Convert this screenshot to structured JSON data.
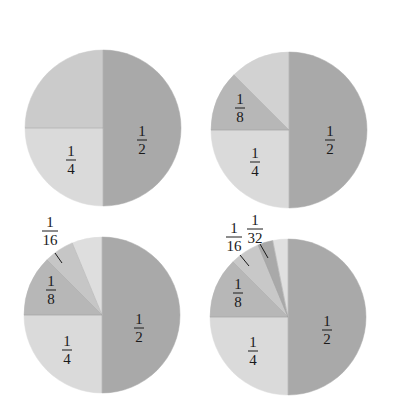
{
  "chart_data": [
    {
      "type": "pie",
      "title": "",
      "center": [
        103,
        128
      ],
      "radius": 78,
      "slices": [
        {
          "label": "1/2",
          "value": 0.5,
          "num": "1",
          "den": "2",
          "color": "#a9a9a9",
          "start": 0,
          "end": 180,
          "labelPos": [
            142,
            140
          ]
        },
        {
          "label": "1/4",
          "value": 0.25,
          "num": "1",
          "den": "4",
          "color": "#dadada",
          "start": 180,
          "end": 270,
          "labelPos": [
            71,
            160
          ]
        },
        {
          "label": "",
          "value": 0.25,
          "num": "",
          "den": "",
          "color": "#cbcbcb",
          "start": 270,
          "end": 360,
          "labelPos": null
        }
      ]
    },
    {
      "type": "pie",
      "title": "",
      "center": [
        289,
        130
      ],
      "radius": 78,
      "slices": [
        {
          "label": "1/2",
          "value": 0.5,
          "num": "1",
          "den": "2",
          "color": "#a9a9a9",
          "start": 0,
          "end": 180,
          "labelPos": [
            330,
            140
          ]
        },
        {
          "label": "1/4",
          "value": 0.25,
          "num": "1",
          "den": "4",
          "color": "#dadada",
          "start": 180,
          "end": 270,
          "labelPos": [
            255,
            162
          ]
        },
        {
          "label": "1/8",
          "value": 0.125,
          "num": "1",
          "den": "8",
          "color": "#b7b7b7",
          "start": 270,
          "end": 315,
          "labelPos": [
            240,
            108
          ]
        },
        {
          "label": "",
          "value": 0.125,
          "num": "",
          "den": "",
          "color": "#d2d2d2",
          "start": 315,
          "end": 360,
          "labelPos": null
        }
      ]
    },
    {
      "type": "pie",
      "title": "",
      "center": [
        102,
        315
      ],
      "radius": 78,
      "slices": [
        {
          "label": "1/2",
          "value": 0.5,
          "num": "1",
          "den": "2",
          "color": "#a9a9a9",
          "start": 0,
          "end": 180,
          "labelPos": [
            139,
            328
          ]
        },
        {
          "label": "1/4",
          "value": 0.25,
          "num": "1",
          "den": "4",
          "color": "#dadada",
          "start": 180,
          "end": 270,
          "labelPos": [
            67,
            350
          ]
        },
        {
          "label": "1/8",
          "value": 0.125,
          "num": "1",
          "den": "8",
          "color": "#b7b7b7",
          "start": 270,
          "end": 315,
          "labelPos": [
            51,
            290
          ]
        },
        {
          "label": "1/16",
          "value": 0.0625,
          "num": "1",
          "den": "16",
          "color": "#c6c6c6",
          "start": 315,
          "end": 337.5,
          "labelPos": [
            50,
            231
          ],
          "leader": [
            [
              55,
              253
            ],
            [
              62,
              263
            ]
          ]
        },
        {
          "label": "",
          "value": 0.0625,
          "num": "",
          "den": "",
          "color": "#dedede",
          "start": 337.5,
          "end": 360,
          "labelPos": null
        }
      ]
    },
    {
      "type": "pie",
      "title": "",
      "center": [
        288,
        317
      ],
      "radius": 78,
      "slices": [
        {
          "label": "1/2",
          "value": 0.5,
          "num": "1",
          "den": "2",
          "color": "#a9a9a9",
          "start": 0,
          "end": 180,
          "labelPos": [
            327,
            330
          ]
        },
        {
          "label": "1/4",
          "value": 0.25,
          "num": "1",
          "den": "4",
          "color": "#dadada",
          "start": 180,
          "end": 270,
          "labelPos": [
            253,
            351
          ]
        },
        {
          "label": "1/8",
          "value": 0.125,
          "num": "1",
          "den": "8",
          "color": "#b7b7b7",
          "start": 270,
          "end": 315,
          "labelPos": [
            238,
            293
          ]
        },
        {
          "label": "1/16",
          "value": 0.0625,
          "num": "1",
          "den": "16",
          "color": "#c8c8c8",
          "start": 315,
          "end": 337.5,
          "labelPos": [
            234,
            237
          ],
          "leader": [
            [
              240,
              255
            ],
            [
              249,
              266
            ]
          ]
        },
        {
          "label": "1/32",
          "value": 0.03125,
          "num": "1",
          "den": "32",
          "color": "#a9a9a9",
          "start": 337.5,
          "end": 348.75,
          "labelPos": [
            255,
            229
          ],
          "leader": [
            [
              260,
              244
            ],
            [
              268,
              258
            ]
          ]
        },
        {
          "label": "",
          "value": 0.03125,
          "num": "",
          "den": "",
          "color": "#e0e0e0",
          "start": 348.75,
          "end": 360,
          "labelPos": null
        }
      ]
    }
  ],
  "figure": {
    "background": "#ffffff"
  }
}
